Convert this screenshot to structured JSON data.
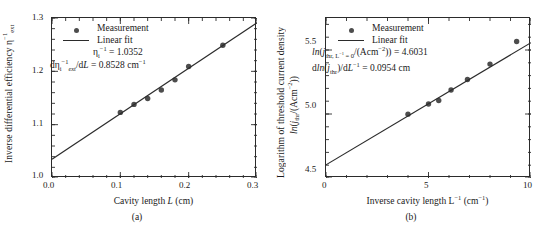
{
  "figure": {
    "panels": [
      {
        "id": "a",
        "caption": "(a)",
        "xlabel_html": "Cavity length <span class=\"it\">L</span> (cm)",
        "ylabel_html": "Inverse differential efficiency η<sup>−1</sup><sub>ext</sub>",
        "legend": {
          "measurement": "Measurement",
          "linear_fit": "Linear fit"
        },
        "annotations": [
          "ηᵢ⁻¹ = 1.0352",
          "dηᵢ⁻¹ext/dL = 0.8528 cm⁻¹"
        ],
        "annotation_html": [
          "η<sub>i</sub><sup>−1</sup> = 1.0352",
          "dη<sub>i</sub><sup>−1</sup><sub><span class=\"it\">ext</span></sub>/d<span class=\"it\">L</span> = 0.8528 cm<sup>−1</sup>"
        ],
        "xticklabels": [
          "0.0",
          "0.1",
          "0.2",
          "0.3"
        ],
        "yticklabels": [
          "1.0",
          "1.1",
          "1.2",
          "1.3"
        ]
      },
      {
        "id": "b",
        "caption": "(b)",
        "xlabel_html": "Inverse cavity length L<sup>−1</sup> (cm<sup>−1</sup>)",
        "ylabel_line1": "Logarithm of threshold current density",
        "ylabel_line2_html": "<span class=\"it\">ln</span>(<span class=\"it\">j</span><sub>thr</sub>/(Acm<sup>−2</sup>))",
        "legend": {
          "measurement": "Measurement",
          "linear_fit": "Linear fit"
        },
        "annotations": [
          "ln(jthr, L⁻¹ = 0/(Acm⁻²)) = 4.6031",
          "dln(jthr)/dL⁻¹ = 0.0954 cm"
        ],
        "annotation_html": [
          "<span class=\"it\">ln</span>(<span class=\"it\">j</span><sub>thr, L<sup>−1</sup> = 0</sub>/(Acm<sup>−2</sup>)) = 4.6031",
          "d<span class=\"it\">ln</span>(<span class=\"it\">j</span><sub>thr</sub>)/d<span class=\"it\">L</span><sup>−1</sup> = 0.0954 cm"
        ],
        "xticklabels": [
          "0",
          "5",
          "10"
        ],
        "yticklabels": [
          "4.5",
          "5.0",
          "5.5"
        ]
      }
    ]
  },
  "chart_data": [
    {
      "type": "scatter",
      "panel": "a",
      "title": "",
      "xlabel": "Cavity length L (cm)",
      "ylabel": "Inverse differential efficiency η⁻¹_ext",
      "xlim": [
        0.0,
        0.3
      ],
      "ylim": [
        1.0,
        1.3
      ],
      "xticks": [
        0.0,
        0.1,
        0.2,
        0.3
      ],
      "yticks": [
        1.0,
        1.1,
        1.2,
        1.3
      ],
      "grid": false,
      "legend_position": "upper-left",
      "series": [
        {
          "name": "Measurement",
          "type": "scatter",
          "marker": "circle",
          "color": "#4d4d4d",
          "x": [
            0.1,
            0.12,
            0.14,
            0.16,
            0.18,
            0.2,
            0.25
          ],
          "y": [
            1.123,
            1.138,
            1.149,
            1.165,
            1.184,
            1.209,
            1.249
          ]
        },
        {
          "name": "Linear fit",
          "type": "line",
          "color": "#2b2b2b",
          "intercept": 1.0352,
          "slope": 0.8528,
          "x": [
            0.0,
            0.3
          ],
          "y": [
            1.0352,
            1.291
          ]
        }
      ],
      "annotations": [
        "ηᵢ⁻¹ = 1.0352",
        "dηᵢ⁻¹_ext/dL = 0.8528 cm⁻¹"
      ]
    },
    {
      "type": "scatter",
      "panel": "b",
      "title": "",
      "xlabel": "Inverse cavity length L⁻¹ (cm⁻¹)",
      "ylabel": "Logarithm of threshold current density ln(j_thr/(Acm⁻²))",
      "xlim": [
        0,
        10
      ],
      "ylim": [
        4.5,
        5.75
      ],
      "xticks": [
        0,
        5,
        10
      ],
      "yticks": [
        4.5,
        5.0,
        5.5
      ],
      "grid": false,
      "legend_position": "upper-left",
      "series": [
        {
          "name": "Measurement",
          "type": "scatter",
          "marker": "circle",
          "color": "#4d4d4d",
          "x": [
            4.0,
            5.0,
            5.5,
            6.1,
            6.9,
            8.0,
            9.3
          ],
          "y": [
            4.999,
            5.078,
            5.106,
            5.188,
            5.27,
            5.39,
            5.566
          ]
        },
        {
          "name": "Linear fit",
          "type": "line",
          "color": "#2b2b2b",
          "intercept": 4.6031,
          "slope": 0.0954,
          "x": [
            0,
            10
          ],
          "y": [
            4.6031,
            5.5571
          ]
        }
      ],
      "annotations": [
        "ln(j_thr, L⁻¹ = 0/(Acm⁻²)) = 4.6031",
        "dln(j_thr)/dL⁻¹ = 0.0954 cm"
      ]
    }
  ]
}
